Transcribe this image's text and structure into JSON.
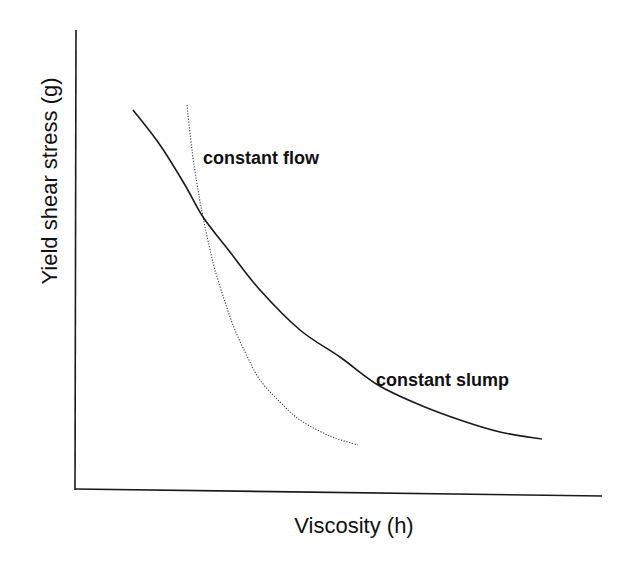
{
  "chart_data": {
    "type": "line",
    "title": "",
    "xlabel": "Viscosity (h)",
    "ylabel": "Yield shear stress (g)",
    "grid": false,
    "legend": null,
    "ticks": {
      "x": [],
      "y": []
    },
    "series": [
      {
        "name": "constant slump",
        "style": "solid",
        "points_px": [
          [
            133,
            110
          ],
          [
            160,
            145
          ],
          [
            185,
            185
          ],
          [
            203,
            217
          ],
          [
            230,
            252
          ],
          [
            260,
            290
          ],
          [
            300,
            330
          ],
          [
            340,
            357
          ],
          [
            378,
            385
          ],
          [
            420,
            405
          ],
          [
            460,
            420
          ],
          [
            500,
            432
          ],
          [
            542,
            439
          ]
        ]
      },
      {
        "name": "constant flow",
        "style": "dotted",
        "points_px": [
          [
            187,
            105
          ],
          [
            192,
            150
          ],
          [
            198,
            190
          ],
          [
            203,
            217
          ],
          [
            209,
            245
          ],
          [
            215,
            270
          ],
          [
            225,
            302
          ],
          [
            235,
            330
          ],
          [
            247,
            356
          ],
          [
            260,
            380
          ],
          [
            280,
            402
          ],
          [
            300,
            420
          ],
          [
            330,
            436
          ],
          [
            358,
            445
          ]
        ]
      }
    ],
    "annotations": [
      {
        "text": "constant flow",
        "x": 203,
        "y": 164
      },
      {
        "text": "constant slump",
        "x": 376,
        "y": 386
      }
    ],
    "axes_px": {
      "origin": [
        76,
        490
      ],
      "y_top": [
        76,
        30
      ],
      "x_end": [
        602,
        496
      ]
    }
  }
}
